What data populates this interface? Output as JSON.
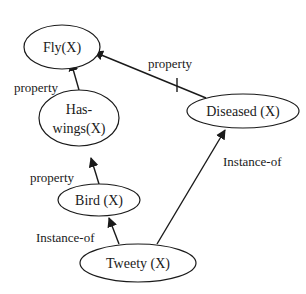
{
  "diagram": {
    "type": "semantic-network",
    "nodes": [
      {
        "id": "fly",
        "label_lines": [
          "Fly(X)"
        ]
      },
      {
        "id": "haswings",
        "label_lines": [
          "Has-",
          "wings(X)"
        ]
      },
      {
        "id": "diseased",
        "label_lines": [
          "Diseased (X)"
        ]
      },
      {
        "id": "bird",
        "label_lines": [
          "Bird (X)"
        ]
      },
      {
        "id": "tweety",
        "label_lines": [
          "Tweety (X)"
        ]
      }
    ],
    "edges": [
      {
        "from": "haswings",
        "to": "fly",
        "label": "property",
        "blocked": false
      },
      {
        "from": "diseased",
        "to": "fly",
        "label": "property",
        "blocked": true
      },
      {
        "from": "bird",
        "to": "haswings",
        "label": "property",
        "blocked": false
      },
      {
        "from": "tweety",
        "to": "bird",
        "label": "Instance-of",
        "blocked": false
      },
      {
        "from": "tweety",
        "to": "diseased",
        "label": "Instance-of",
        "blocked": false
      }
    ]
  }
}
